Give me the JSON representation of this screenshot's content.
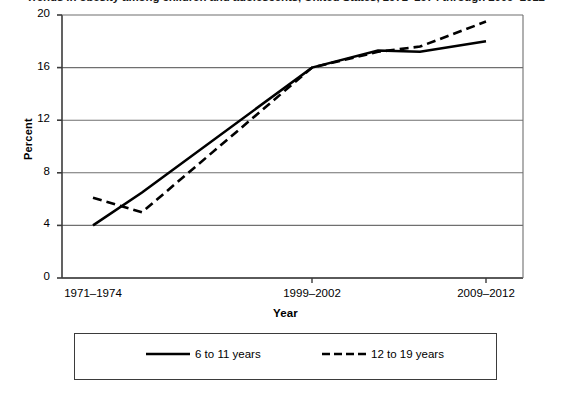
{
  "figure": {
    "title_clipped": "Trends in obesity among children and adolescents, United States, 1971–1974 through 2009–2012",
    "background_color": "#ffffff",
    "axis_color": "#3b3b3b",
    "series_color": "#000000"
  },
  "chart_data": {
    "type": "line",
    "title": "",
    "xlabel": "Year",
    "ylabel": "Percent",
    "ylim": [
      0,
      20
    ],
    "yticks": [
      0,
      4,
      8,
      12,
      16,
      20
    ],
    "ytick_labels": [
      "0",
      "4",
      "8",
      "12",
      "16",
      "20"
    ],
    "grid": true,
    "grid_axis": "y",
    "legend_position": "below-center",
    "x": [
      "1971–1974",
      "1976–1980",
      "1999–2002",
      "2003–2006",
      "2005–2008",
      "2009–2012"
    ],
    "xtick_labels": [
      "1971–1974",
      "1999–2002",
      "2009–2012"
    ],
    "xtick_positions": [
      0,
      2,
      5
    ],
    "series": [
      {
        "name": "6 to 11 years",
        "style": "solid",
        "values": [
          4.0,
          6.5,
          16.0,
          17.3,
          17.2,
          18.0
        ]
      },
      {
        "name": "12 to 19 years",
        "style": "dashed",
        "values": [
          6.1,
          5.0,
          16.0,
          17.2,
          17.6,
          19.5
        ]
      }
    ]
  },
  "legend": {
    "items": [
      {
        "label": "6 to 11 years",
        "style": "solid"
      },
      {
        "label": "12 to 19 years",
        "style": "dashed"
      }
    ]
  }
}
